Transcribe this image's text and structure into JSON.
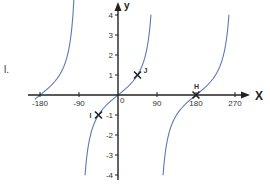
{
  "stray_text": "l.",
  "chart_data": {
    "type": "line",
    "title": "",
    "function": "y = tan(x)",
    "xlabel": "X",
    "ylabel": "y",
    "xlim": [
      -200,
      290
    ],
    "ylim": [
      -4.2,
      4.5
    ],
    "grid": false,
    "x_ticks": [
      -180,
      -90,
      90,
      180,
      270
    ],
    "x_tick_labels": [
      "-180",
      "-90",
      "90",
      "180",
      "270"
    ],
    "y_ticks": [
      -4,
      -3,
      -2,
      -1,
      1,
      2,
      3,
      4
    ],
    "y_tick_labels": [
      "-4",
      "-3",
      "-2",
      "-1",
      "1",
      "2",
      "3",
      "4"
    ],
    "origin_label": "0",
    "asymptotes": [
      -90,
      90
    ],
    "series": [
      {
        "name": "tan(x) branch left",
        "x": [
          -190,
          -180,
          -150,
          -120,
          -106,
          -101
        ],
        "values": [
          -0.18,
          0,
          0.58,
          1.73,
          3.5,
          4.0
        ]
      },
      {
        "name": "tan(x) branch center",
        "x": [
          -76,
          -60,
          -45,
          -30,
          0,
          30,
          45,
          60,
          76
        ],
        "values": [
          -4.0,
          -1.73,
          -1,
          -0.58,
          0,
          0.58,
          1,
          1.73,
          4.0
        ]
      },
      {
        "name": "tan(x) branch right",
        "x": [
          104,
          120,
          150,
          180,
          210,
          240,
          256
        ],
        "values": [
          -4.0,
          -1.73,
          -0.58,
          0,
          0.58,
          1.73,
          4.0
        ]
      }
    ],
    "points": [
      {
        "label": "J",
        "x": 45,
        "y": 1
      },
      {
        "label": "I",
        "x": -45,
        "y": -1
      },
      {
        "label": "H",
        "x": 180,
        "y": 0
      }
    ],
    "colors": {
      "curve": "#5b78b8",
      "axis": "#222222",
      "marker": "#222222"
    }
  }
}
